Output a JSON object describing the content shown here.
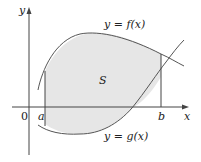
{
  "figure": {
    "axes": {
      "x_label": "x",
      "y_label": "y",
      "origin_label": "0"
    },
    "bounds": {
      "left_label": "a",
      "right_label": "b"
    },
    "curves": {
      "upper_label": "y = f(x)",
      "lower_label": "y = g(x)"
    },
    "region_label": "S",
    "colors": {
      "region_fill": "#e6e6e6",
      "stroke": "#555555"
    }
  }
}
